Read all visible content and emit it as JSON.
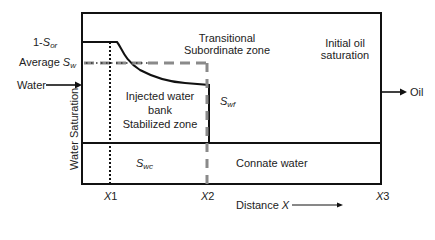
{
  "diagram": {
    "y_axis_label": "Water Saturation",
    "x_axis_label": "Distance",
    "x_axis_symbol": "X",
    "x_ticks": [
      {
        "label": "X",
        "sub": "1"
      },
      {
        "label": "X",
        "sub": "2"
      },
      {
        "label": "X",
        "sub": "3"
      }
    ],
    "left_labels": {
      "one_minus_sor": {
        "prefix": "1-",
        "symbol": "S",
        "sub": "or"
      },
      "average_sw": {
        "prefix": "Average ",
        "symbol": "S",
        "sub": "w"
      },
      "water_inlet": "Water"
    },
    "right_labels": {
      "oil_outlet": "Oil"
    },
    "zones": {
      "transitional": [
        "Transitional",
        "Subordinate zone"
      ],
      "initial_oil": [
        "Initial oil",
        "saturation"
      ],
      "injected_bank": [
        "Injected water",
        "bank",
        "Stabilized zone"
      ],
      "connate": "Connate water"
    },
    "symbols": {
      "swf": {
        "symbol": "S",
        "sub": "wf"
      },
      "swc": {
        "symbol": "S",
        "sub": "wc"
      }
    },
    "colors": {
      "line": "#111111",
      "dashed": "#8a8a8a",
      "text": "#222222"
    }
  }
}
